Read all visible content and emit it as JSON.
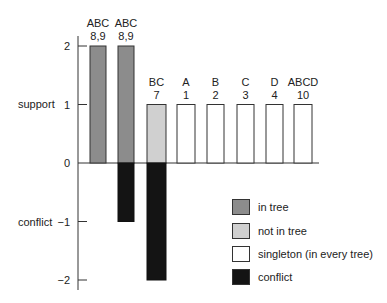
{
  "chart_data": {
    "type": "bar",
    "title": "",
    "xlabel": "",
    "ylabel_positive": "support",
    "ylabel_negative": "conflict",
    "ylim": [
      -2,
      2
    ],
    "yticks": [
      2,
      1,
      0,
      -1,
      -2
    ],
    "grid": false,
    "legend_position": "lower right",
    "bars": [
      {
        "label_top": "ABC",
        "label_bottom": "8,9",
        "support": 2,
        "conflict": 0,
        "category": "in tree"
      },
      {
        "label_top": "ABC",
        "label_bottom": "8,9",
        "support": 2,
        "conflict": -1,
        "category": "in tree"
      },
      {
        "label_top": "BC",
        "label_bottom": "7",
        "support": 1,
        "conflict": -2,
        "category": "not in tree"
      },
      {
        "label_top": "A",
        "label_bottom": "1",
        "support": 1,
        "conflict": 0,
        "category": "singleton (in every tree)"
      },
      {
        "label_top": "B",
        "label_bottom": "2",
        "support": 1,
        "conflict": 0,
        "category": "singleton (in every tree)"
      },
      {
        "label_top": "C",
        "label_bottom": "3",
        "support": 1,
        "conflict": 0,
        "category": "singleton (in every tree)"
      },
      {
        "label_top": "D",
        "label_bottom": "4",
        "support": 1,
        "conflict": 0,
        "category": "singleton (in every tree)"
      },
      {
        "label_top": "ABCD",
        "label_bottom": "10",
        "support": 1,
        "conflict": 0,
        "category": "singleton (in every tree)"
      }
    ],
    "series": [
      {
        "name": "support",
        "values": [
          2,
          2,
          1,
          1,
          1,
          1,
          1,
          1
        ]
      },
      {
        "name": "conflict",
        "values": [
          0,
          -1,
          -2,
          0,
          0,
          0,
          0,
          0
        ]
      }
    ],
    "categories": [
      "ABC 8,9",
      "ABC 8,9",
      "BC 7",
      "A 1",
      "B 2",
      "C 3",
      "D 4",
      "ABCD 10"
    ],
    "legend": [
      {
        "label": "in tree",
        "color": "#8c8c8c"
      },
      {
        "label": "not in tree",
        "color": "#d0d0d0"
      },
      {
        "label": "singleton (in every tree)",
        "color": "#ffffff"
      },
      {
        "label": "conflict",
        "color": "#141414"
      }
    ]
  },
  "colors": {
    "in_tree": "#8c8c8c",
    "not_in_tree": "#d0d0d0",
    "singleton": "#ffffff",
    "conflict": "#141414",
    "axis": "#333333"
  }
}
